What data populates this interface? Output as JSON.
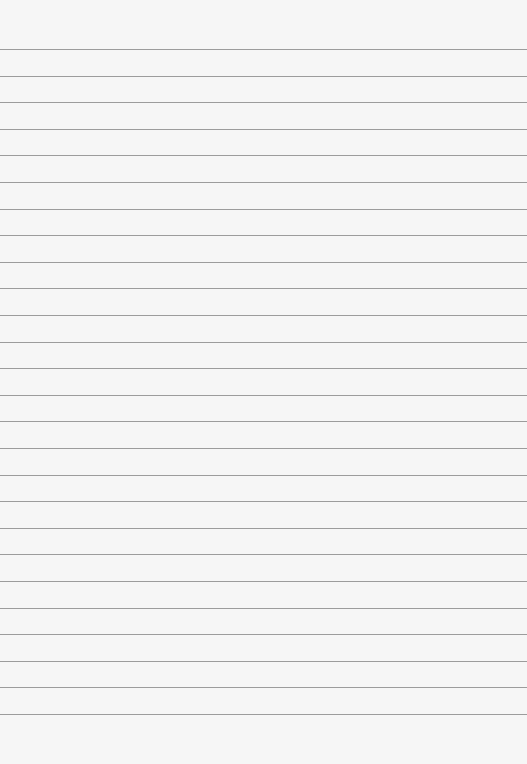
{
  "paper": {
    "background": "#f6f6f6",
    "line_color": "#8c8c8c",
    "first_line_y": 49,
    "line_spacing": 26.6,
    "line_count": 26
  }
}
